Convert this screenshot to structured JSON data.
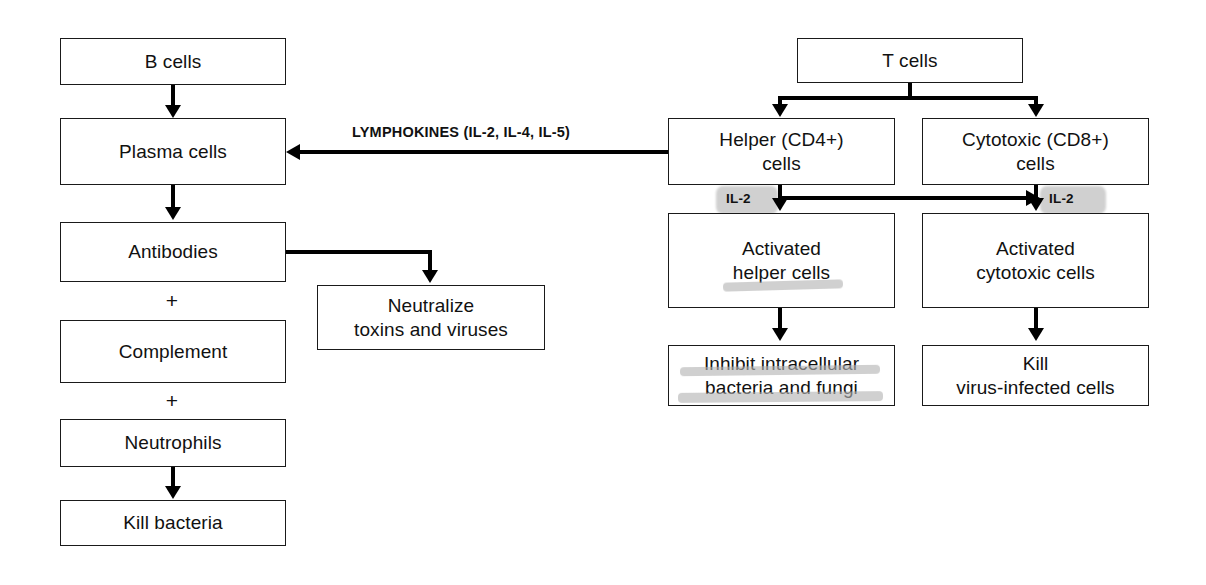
{
  "diagram": {
    "width": 1206,
    "height": 585,
    "background_color": "#ffffff",
    "line_color": "#000000",
    "highlight_color": "#b4b4b4"
  },
  "humoral_branch": {
    "b_cells": "B cells",
    "plasma_cells": "Plasma cells",
    "antibodies": "Antibodies",
    "plus_1": "+",
    "complement": "Complement",
    "plus_2": "+",
    "neutrophils": "Neutrophils",
    "kill_bacteria": "Kill bacteria",
    "neutralize": "Neutralize\ntoxins and viruses"
  },
  "cellular_branch": {
    "t_cells": "T cells",
    "helper_cells": "Helper (CD4+)\ncells",
    "cytotoxic_cells": "Cytotoxic (CD8+)\ncells",
    "activated_helper": "Activated\nhelper cells",
    "activated_cytotoxic": "Activated\ncytotoxic cells",
    "inhibit": "Inhibit intracellular\nbacteria and fungi",
    "kill_virus_infected": "Kill\nvirus-infected cells"
  },
  "edge_labels": {
    "lymphokines": "LYMPHOKINES (IL-2, IL-4, IL-5)",
    "il2_helper": "IL-2",
    "il2_cytotoxic": "IL-2"
  }
}
